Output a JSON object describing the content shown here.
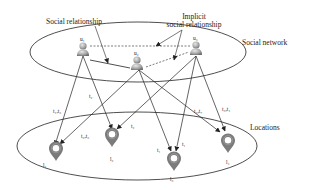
{
  "labels": {
    "social_relationship": "Social relationship",
    "implicit_line1": "Implicit",
    "implicit_line2": "social relationship",
    "social_network": "Social network",
    "locations": "Locations"
  },
  "users": [
    {
      "id": "u1",
      "label": "u₁"
    },
    {
      "id": "u2",
      "label": "u₂"
    },
    {
      "id": "u3",
      "label": "u₃"
    }
  ],
  "locations": [
    {
      "id": "l1",
      "label": "l₁"
    },
    {
      "id": "l2",
      "label": "l₂"
    },
    {
      "id": "l3",
      "label": "l₃"
    },
    {
      "id": "l4",
      "label": "l₄"
    }
  ],
  "edge_labels": {
    "u1_l1": "t₁,t₃",
    "u1_l2": "t₂",
    "u2_l1": "t₂,t₃",
    "u2_l2": "t₂",
    "u2_l3": "t₁",
    "u3_l3": "t₁",
    "u2_l4": "t₄,t₇",
    "u3_l4": "t₃,t₄"
  },
  "colors": {
    "line": "#222222",
    "pin": "#7a7a7a",
    "person": "#9a9a9a"
  }
}
